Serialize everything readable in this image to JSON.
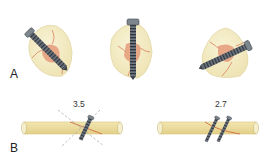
{
  "figure": {
    "panel_a": {
      "label": "A",
      "items": [
        {
          "name": "fragment-oblique-screw",
          "screw_orientation": "diagonal-down-right"
        },
        {
          "name": "fragment-vertical-screw",
          "screw_orientation": "vertical"
        },
        {
          "name": "fragment-oblique-screw-reverse",
          "screw_orientation": "diagonal-up-right"
        }
      ]
    },
    "panel_b": {
      "label": "B",
      "items": [
        {
          "size_label": "3.5",
          "screws": 1,
          "guides": "dashed-cross"
        },
        {
          "size_label": "2.7",
          "screws": 2
        }
      ]
    },
    "colors": {
      "bone_fragment": "#f4edc6",
      "bone_outline": "#e2d7a6",
      "fracture_piece": "#e6a07e",
      "fracture_line": "#d0603c",
      "long_bone": "#eadb9c",
      "long_bone_edge": "#d9c57e",
      "screw": "#6f7780",
      "screw_dark": "#3f464e",
      "guide_dash": "#9aa3ab"
    }
  }
}
